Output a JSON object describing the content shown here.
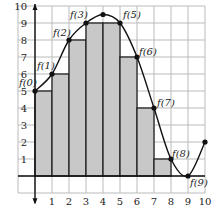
{
  "chart_data": {
    "type": "area",
    "title": "",
    "xlabel": "",
    "ylabel": "",
    "xlim": [
      0,
      10
    ],
    "ylim": [
      0,
      10
    ],
    "grid": true,
    "x_ticks": [
      "1",
      "2",
      "3",
      "4",
      "5",
      "6",
      "7",
      "8",
      "9",
      "10"
    ],
    "y_ticks": [
      "1",
      "2",
      "3",
      "4",
      "5",
      "6",
      "7",
      "8",
      "9",
      "10"
    ],
    "curve": {
      "name": "f",
      "points": [
        {
          "x": 0,
          "y": 5,
          "label": "f(0)"
        },
        {
          "x": 1,
          "y": 6,
          "label": "f(1)"
        },
        {
          "x": 2,
          "y": 8,
          "label": "f(2)"
        },
        {
          "x": 3,
          "y": 9,
          "label": "f(3)"
        },
        {
          "x": 4,
          "y": 9.5,
          "label": ""
        },
        {
          "x": 5,
          "y": 9,
          "label": "f(5)"
        },
        {
          "x": 6,
          "y": 7,
          "label": "f(6)"
        },
        {
          "x": 7,
          "y": 4,
          "label": "f(7)"
        },
        {
          "x": 8,
          "y": 1,
          "label": "f(8)"
        },
        {
          "x": 9,
          "y": 0,
          "label": "f(9)"
        },
        {
          "x": 10,
          "y": 2,
          "label": ""
        }
      ]
    },
    "rectangles": {
      "description": "lower Riemann sum rectangles",
      "x_start": [
        0,
        1,
        2,
        3,
        4,
        5,
        6,
        7,
        8
      ],
      "heights": [
        5,
        6,
        8,
        9,
        9,
        7,
        4,
        1,
        0
      ],
      "fill": "#c8c8c8"
    },
    "colors": {
      "curve": "#111111",
      "grid": "#bbbbbb",
      "fill": "#c8c8c8"
    }
  }
}
